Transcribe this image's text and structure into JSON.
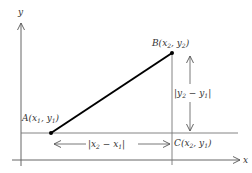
{
  "diagram": {
    "axes": {
      "x_label": "x",
      "y_label": "y"
    },
    "points": [
      {
        "name": "A",
        "label": "A(x₁, y₁)",
        "label_main": "A(x",
        "sub1": "1",
        "mid": ", y",
        "sub2": "1",
        "end": ")"
      },
      {
        "name": "B",
        "label": "B(x₂, y₂)",
        "label_main": "B(x",
        "sub1": "2",
        "mid": ", y",
        "sub2": "2",
        "end": ")"
      },
      {
        "name": "C",
        "label": "C(x₂, y₁)",
        "label_main": "C(x",
        "sub1": "2",
        "mid": ", y",
        "sub2": "1",
        "end": ")"
      }
    ],
    "measurements": {
      "horizontal": {
        "label": "|x₂ − x₁|",
        "pre": "|x",
        "s1": "2",
        "mid": " − x",
        "s2": "1",
        "post": "|"
      },
      "vertical": {
        "label": "|y₂ − y₁|",
        "pre": "|y",
        "s1": "2",
        "mid": " − y",
        "s2": "1",
        "post": "|"
      }
    },
    "colors": {
      "line": "#000000",
      "axis": "#555555",
      "text": "#333333"
    }
  }
}
